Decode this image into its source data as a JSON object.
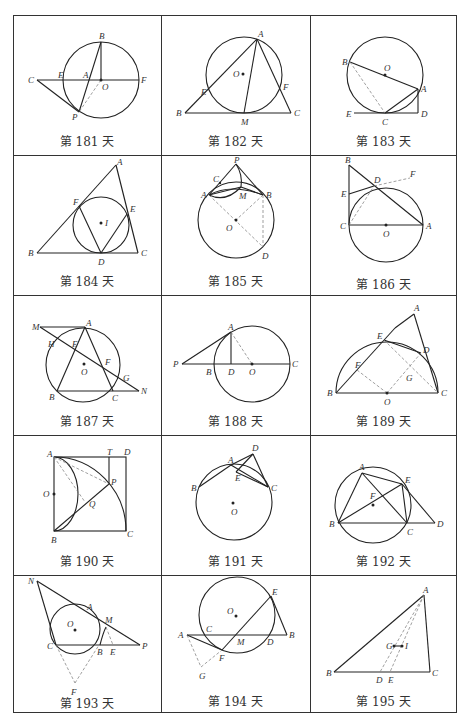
{
  "page": {
    "grid": {
      "rows": 5,
      "columns": 3
    }
  },
  "cells": [
    {
      "day": "第 181 天",
      "labels": [
        "B",
        "C",
        "E",
        "A",
        "O",
        "F",
        "P"
      ]
    },
    {
      "day": "第 182 天",
      "labels": [
        "A",
        "O",
        "E",
        "F",
        "B",
        "M",
        "C"
      ]
    },
    {
      "day": "第 183 天",
      "labels": [
        "B",
        "O",
        "A",
        "E",
        "C",
        "D"
      ]
    },
    {
      "day": "第 184 天",
      "labels": [
        "A",
        "F",
        "I",
        "E",
        "B",
        "D",
        "C"
      ]
    },
    {
      "day": "第 185 天",
      "labels": [
        "P",
        "C",
        "A",
        "M",
        "B",
        "O",
        "D"
      ]
    },
    {
      "day": "第 186 天",
      "labels": [
        "B",
        "D",
        "F",
        "E",
        "C",
        "O",
        "A"
      ]
    },
    {
      "day": "第 187 天",
      "labels": [
        "M",
        "A",
        "H",
        "E",
        "O",
        "F",
        "G",
        "B",
        "C",
        "N"
      ]
    },
    {
      "day": "第 188 天",
      "labels": [
        "A",
        "P",
        "B",
        "D",
        "O",
        "C"
      ]
    },
    {
      "day": "第 189 天",
      "labels": [
        "A",
        "E",
        "D",
        "F",
        "G",
        "B",
        "O",
        "C"
      ]
    },
    {
      "day": "第 190 天",
      "labels": [
        "A",
        "T",
        "D",
        "O",
        "P",
        "Q",
        "B",
        "C"
      ]
    },
    {
      "day": "第 191 天",
      "labels": [
        "D",
        "A",
        "E",
        "B",
        "C",
        "O"
      ]
    },
    {
      "day": "第 192 天",
      "labels": [
        "A",
        "E",
        "F",
        "B",
        "C",
        "D"
      ]
    },
    {
      "day": "第 193 天",
      "labels": [
        "N",
        "A",
        "M",
        "O",
        "C",
        "B",
        "E",
        "P",
        "F"
      ]
    },
    {
      "day": "第 194 天",
      "labels": [
        "E",
        "O",
        "A",
        "C",
        "M",
        "D",
        "B",
        "F",
        "G"
      ]
    },
    {
      "day": "第 195 天",
      "labels": [
        "A",
        "G",
        "I",
        "B",
        "D",
        "E",
        "C"
      ]
    }
  ]
}
